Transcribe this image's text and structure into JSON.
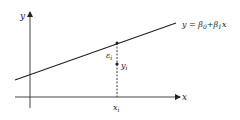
{
  "diagram": {
    "axes": {
      "x_label": "x",
      "y_label": "y"
    },
    "regression_line": {
      "equation_prefix": "y = ",
      "beta0": "β",
      "beta0_sub": "0",
      "plus": "+",
      "beta1": "β",
      "beta1_sub": "1",
      "var": "x"
    },
    "observation": {
      "x_label": "x",
      "x_sub": "i",
      "y_label": "y",
      "y_sub": "i",
      "error_label": "ε",
      "error_sub": "i"
    },
    "colors": {
      "line": "#222222",
      "axis": "#444444"
    }
  }
}
